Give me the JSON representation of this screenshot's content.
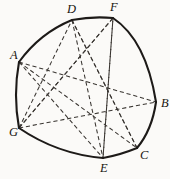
{
  "figure": {
    "background_color": "#fbfaf8",
    "outline_color": "#1d1a18",
    "chord_color": "#3a3632",
    "label_color": "#18150f",
    "vertices": [
      {
        "id": "A",
        "label": "A",
        "x": 19,
        "y": 62,
        "label_x": 10,
        "label_y": 59
      },
      {
        "id": "D",
        "label": "D",
        "x": 72,
        "y": 20,
        "label_x": 67,
        "label_y": 13
      },
      {
        "id": "F",
        "label": "F",
        "x": 113,
        "y": 18,
        "label_x": 110,
        "label_y": 11
      },
      {
        "id": "B",
        "label": "B",
        "x": 156,
        "y": 102,
        "label_x": 161,
        "label_y": 107
      },
      {
        "id": "C",
        "label": "C",
        "x": 137,
        "y": 148,
        "label_x": 140,
        "label_y": 159
      },
      {
        "id": "E",
        "label": "E",
        "x": 103,
        "y": 158,
        "label_x": 100,
        "label_y": 172
      },
      {
        "id": "G",
        "label": "G",
        "x": 19,
        "y": 128,
        "label_x": 9,
        "label_y": 136
      }
    ],
    "outline_path": "M 19 62 Q 40 33 72 20 Q 93 16 113 18 Q 146 40 156 102 Q 152 130 137 148 Q 120 155 103 158 Q 57 154 19 128 Q 13 95 19 62 Z",
    "outline_style": "solid",
    "chord_style": "dashed",
    "chords": [
      {
        "from": "A",
        "to": "B"
      },
      {
        "from": "A",
        "to": "C"
      },
      {
        "from": "A",
        "to": "E"
      },
      {
        "from": "G",
        "to": "B"
      },
      {
        "from": "G",
        "to": "D"
      },
      {
        "from": "G",
        "to": "F"
      },
      {
        "from": "D",
        "to": "C"
      },
      {
        "from": "D",
        "to": "E"
      },
      {
        "from": "F",
        "to": "E"
      },
      {
        "from": "F",
        "to": "G"
      },
      {
        "from": "E",
        "to": "F"
      },
      {
        "from": "C",
        "to": "D"
      }
    ]
  }
}
